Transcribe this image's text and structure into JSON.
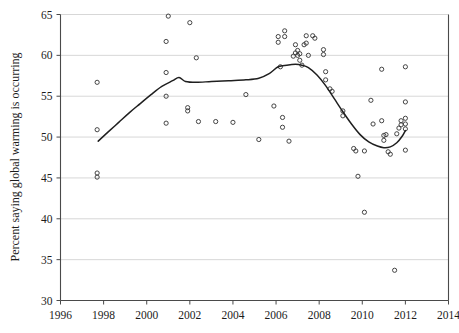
{
  "chart_data": {
    "type": "scatter",
    "title": "",
    "subtitle": "",
    "xlabel": "",
    "ylabel": "Percent saying global warming is occurring",
    "xlim": [
      1996,
      2014
    ],
    "ylim": [
      30,
      65
    ],
    "xticks": [
      1996,
      1998,
      2000,
      2002,
      2004,
      2006,
      2008,
      2010,
      2012,
      2014
    ],
    "xtick_labels": [
      "1996",
      "1998",
      "2000",
      "2002",
      "2004",
      "2006",
      "2008",
      "2010",
      "2012",
      "2014"
    ],
    "yticks": [
      30,
      35,
      40,
      45,
      50,
      55,
      60,
      65
    ],
    "ytick_labels": [
      "30",
      "35",
      "40",
      "45",
      "50",
      "55",
      "60",
      "65"
    ],
    "grid": "horizontal",
    "legend": "none",
    "marker": "open-circle",
    "points": [
      {
        "x": 1997.7,
        "y": 56.7
      },
      {
        "x": 1997.7,
        "y": 50.9
      },
      {
        "x": 1997.7,
        "y": 45.6
      },
      {
        "x": 1997.7,
        "y": 45.1
      },
      {
        "x": 2000.9,
        "y": 61.7
      },
      {
        "x": 2000.9,
        "y": 57.9
      },
      {
        "x": 2000.9,
        "y": 55.0
      },
      {
        "x": 2000.9,
        "y": 51.7
      },
      {
        "x": 2001.0,
        "y": 64.8
      },
      {
        "x": 2001.9,
        "y": 53.6
      },
      {
        "x": 2001.9,
        "y": 53.2
      },
      {
        "x": 2002.0,
        "y": 64.0
      },
      {
        "x": 2002.3,
        "y": 59.7
      },
      {
        "x": 2002.4,
        "y": 51.9
      },
      {
        "x": 2003.2,
        "y": 51.9
      },
      {
        "x": 2004.0,
        "y": 51.8
      },
      {
        "x": 2004.6,
        "y": 55.2
      },
      {
        "x": 2005.2,
        "y": 49.7
      },
      {
        "x": 2005.9,
        "y": 53.8
      },
      {
        "x": 2006.1,
        "y": 62.3
      },
      {
        "x": 2006.1,
        "y": 61.6
      },
      {
        "x": 2006.2,
        "y": 58.6
      },
      {
        "x": 2006.3,
        "y": 52.4
      },
      {
        "x": 2006.3,
        "y": 51.2
      },
      {
        "x": 2006.4,
        "y": 63.0
      },
      {
        "x": 2006.4,
        "y": 62.3
      },
      {
        "x": 2006.6,
        "y": 49.5
      },
      {
        "x": 2006.8,
        "y": 59.9
      },
      {
        "x": 2006.9,
        "y": 60.3
      },
      {
        "x": 2006.9,
        "y": 61.3
      },
      {
        "x": 2007.0,
        "y": 60.6
      },
      {
        "x": 2007.0,
        "y": 60.0
      },
      {
        "x": 2007.1,
        "y": 60.2
      },
      {
        "x": 2007.1,
        "y": 59.4
      },
      {
        "x": 2007.2,
        "y": 58.8
      },
      {
        "x": 2007.3,
        "y": 61.3
      },
      {
        "x": 2007.4,
        "y": 62.4
      },
      {
        "x": 2007.4,
        "y": 61.5
      },
      {
        "x": 2007.5,
        "y": 60.0
      },
      {
        "x": 2007.7,
        "y": 62.4
      },
      {
        "x": 2007.8,
        "y": 62.1
      },
      {
        "x": 2008.2,
        "y": 60.7
      },
      {
        "x": 2008.2,
        "y": 60.1
      },
      {
        "x": 2008.3,
        "y": 58.0
      },
      {
        "x": 2008.3,
        "y": 57.0
      },
      {
        "x": 2008.5,
        "y": 55.9
      },
      {
        "x": 2008.6,
        "y": 55.6
      },
      {
        "x": 2009.1,
        "y": 53.2
      },
      {
        "x": 2009.1,
        "y": 52.6
      },
      {
        "x": 2009.6,
        "y": 48.6
      },
      {
        "x": 2009.7,
        "y": 48.3
      },
      {
        "x": 2009.8,
        "y": 45.2
      },
      {
        "x": 2010.1,
        "y": 48.3
      },
      {
        "x": 2010.1,
        "y": 40.8
      },
      {
        "x": 2010.4,
        "y": 54.5
      },
      {
        "x": 2010.5,
        "y": 51.6
      },
      {
        "x": 2010.9,
        "y": 58.3
      },
      {
        "x": 2010.9,
        "y": 52.0
      },
      {
        "x": 2011.0,
        "y": 50.2
      },
      {
        "x": 2011.0,
        "y": 49.6
      },
      {
        "x": 2011.1,
        "y": 50.3
      },
      {
        "x": 2011.2,
        "y": 48.2
      },
      {
        "x": 2011.3,
        "y": 47.9
      },
      {
        "x": 2011.5,
        "y": 33.7
      },
      {
        "x": 2011.6,
        "y": 50.4
      },
      {
        "x": 2011.7,
        "y": 51.1
      },
      {
        "x": 2011.8,
        "y": 52.0
      },
      {
        "x": 2011.8,
        "y": 51.5
      },
      {
        "x": 2012.0,
        "y": 58.6
      },
      {
        "x": 2012.0,
        "y": 54.3
      },
      {
        "x": 2012.0,
        "y": 52.3
      },
      {
        "x": 2012.0,
        "y": 51.6
      },
      {
        "x": 2012.0,
        "y": 51.0
      },
      {
        "x": 2012.0,
        "y": 48.4
      }
    ],
    "trend_line": {
      "name": "smoothed trend",
      "points": [
        {
          "x": 1997.75,
          "y": 49.5
        },
        {
          "x": 1998.2,
          "y": 50.6
        },
        {
          "x": 1998.7,
          "y": 51.8
        },
        {
          "x": 1999.2,
          "y": 53.0
        },
        {
          "x": 1999.7,
          "y": 54.1
        },
        {
          "x": 2000.2,
          "y": 55.2
        },
        {
          "x": 2000.7,
          "y": 56.2
        },
        {
          "x": 2001.2,
          "y": 56.9
        },
        {
          "x": 2001.5,
          "y": 57.3
        },
        {
          "x": 2001.8,
          "y": 56.8
        },
        {
          "x": 2002.3,
          "y": 56.7
        },
        {
          "x": 2003.0,
          "y": 56.8
        },
        {
          "x": 2003.8,
          "y": 56.9
        },
        {
          "x": 2004.6,
          "y": 57.0
        },
        {
          "x": 2005.2,
          "y": 57.2
        },
        {
          "x": 2005.7,
          "y": 57.8
        },
        {
          "x": 2006.1,
          "y": 58.6
        },
        {
          "x": 2006.5,
          "y": 58.8
        },
        {
          "x": 2006.9,
          "y": 58.9
        },
        {
          "x": 2007.2,
          "y": 58.8
        },
        {
          "x": 2007.5,
          "y": 58.5
        },
        {
          "x": 2007.9,
          "y": 57.6
        },
        {
          "x": 2008.3,
          "y": 56.3
        },
        {
          "x": 2008.7,
          "y": 54.7
        },
        {
          "x": 2009.1,
          "y": 53.1
        },
        {
          "x": 2009.5,
          "y": 51.6
        },
        {
          "x": 2009.9,
          "y": 50.3
        },
        {
          "x": 2010.3,
          "y": 49.4
        },
        {
          "x": 2010.7,
          "y": 48.9
        },
        {
          "x": 2011.0,
          "y": 48.7
        },
        {
          "x": 2011.3,
          "y": 48.8
        },
        {
          "x": 2011.6,
          "y": 49.3
        },
        {
          "x": 2011.85,
          "y": 50.1
        },
        {
          "x": 2012.0,
          "y": 50.8
        }
      ]
    }
  }
}
